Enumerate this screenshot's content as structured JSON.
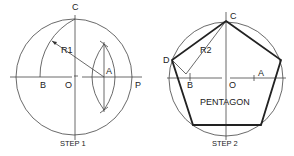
{
  "step1": {
    "caption": "STEP 1",
    "labels": {
      "C": "C",
      "R1": "R1",
      "A": "A",
      "B": "B",
      "O": "O",
      "P": "P"
    }
  },
  "step2": {
    "caption": "STEP 2",
    "labels": {
      "C": "C",
      "R2": "R2",
      "D": "D",
      "B": "B",
      "O": "O",
      "A": "A"
    },
    "shape_label": "PENTAGON"
  },
  "colors": {
    "line": "#444444",
    "text": "#222222",
    "background": "#ffffff"
  }
}
